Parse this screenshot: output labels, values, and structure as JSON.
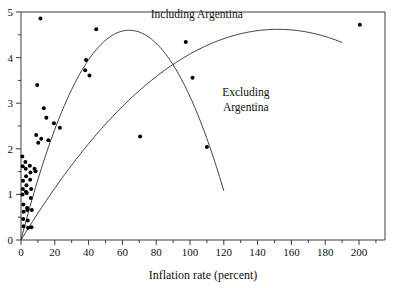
{
  "chart_data": {
    "type": "scatter",
    "title": "",
    "subtitle": "",
    "xlabel": "Inflation rate (percent)",
    "ylabel": "",
    "xlim": [
      0,
      212
    ],
    "ylim": [
      0,
      5
    ],
    "grid": false,
    "legend_position": "inline-annotations",
    "x_ticks": [
      0,
      20,
      40,
      60,
      80,
      100,
      120,
      140,
      160,
      180,
      200
    ],
    "x_tick_labels": [
      "0",
      "20",
      "40",
      "60",
      "80",
      "100",
      "120",
      "140",
      "160",
      "180",
      "200"
    ],
    "x_minor_ticks": [
      10,
      30,
      50,
      70,
      90,
      110,
      130,
      150,
      170,
      190,
      210
    ],
    "y_ticks": [
      0,
      1,
      2,
      3,
      4,
      5
    ],
    "y_tick_labels": [
      "0",
      "1",
      "2",
      "3",
      "4",
      "5"
    ],
    "y_minor_ticks": [
      0.5,
      1.5,
      2.5,
      3.5,
      4.5
    ],
    "points": [
      {
        "x": 0.8,
        "y": 1.83
      },
      {
        "x": 1.0,
        "y": 1.62
      },
      {
        "x": 1.2,
        "y": 1.3
      },
      {
        "x": 1.1,
        "y": 1.12
      },
      {
        "x": 0.9,
        "y": 1.0
      },
      {
        "x": 1.4,
        "y": 0.78
      },
      {
        "x": 1.6,
        "y": 0.62
      },
      {
        "x": 1.3,
        "y": 0.46
      },
      {
        "x": 1.5,
        "y": 0.3
      },
      {
        "x": 2.6,
        "y": 1.71
      },
      {
        "x": 2.8,
        "y": 1.56
      },
      {
        "x": 3.0,
        "y": 1.4
      },
      {
        "x": 3.2,
        "y": 1.2
      },
      {
        "x": 2.9,
        "y": 1.06
      },
      {
        "x": 3.4,
        "y": 1.03
      },
      {
        "x": 3.6,
        "y": 0.7
      },
      {
        "x": 3.8,
        "y": 0.66
      },
      {
        "x": 4.0,
        "y": 0.43
      },
      {
        "x": 4.2,
        "y": 0.27
      },
      {
        "x": 5.2,
        "y": 1.63
      },
      {
        "x": 5.6,
        "y": 1.48
      },
      {
        "x": 5.4,
        "y": 1.32
      },
      {
        "x": 6.0,
        "y": 1.12
      },
      {
        "x": 5.8,
        "y": 0.92
      },
      {
        "x": 6.4,
        "y": 0.66
      },
      {
        "x": 6.2,
        "y": 0.28
      },
      {
        "x": 8.0,
        "y": 1.56
      },
      {
        "x": 8.6,
        "y": 1.51
      },
      {
        "x": 9.0,
        "y": 2.3
      },
      {
        "x": 10.2,
        "y": 2.13
      },
      {
        "x": 9.6,
        "y": 3.4
      },
      {
        "x": 11.5,
        "y": 4.86
      },
      {
        "x": 12.0,
        "y": 2.22
      },
      {
        "x": 13.5,
        "y": 2.89
      },
      {
        "x": 15.0,
        "y": 2.68
      },
      {
        "x": 16.2,
        "y": 2.19
      },
      {
        "x": 19.5,
        "y": 2.56
      },
      {
        "x": 23.0,
        "y": 2.46
      },
      {
        "x": 38.5,
        "y": 3.95
      },
      {
        "x": 38.0,
        "y": 3.72
      },
      {
        "x": 40.5,
        "y": 3.61
      },
      {
        "x": 44.5,
        "y": 4.62
      },
      {
        "x": 70.5,
        "y": 2.27
      },
      {
        "x": 97.5,
        "y": 4.34
      },
      {
        "x": 101.5,
        "y": 3.56
      },
      {
        "x": 110.0,
        "y": 2.04
      },
      {
        "x": 200.5,
        "y": 4.72
      }
    ],
    "curves": [
      {
        "name": "Including Argentina",
        "label": "Including Argentina",
        "x_range": [
          0,
          190
        ],
        "vertex_x": 152,
        "vertex_y": 4.62,
        "y_at_x0": 0.0,
        "description": "Concave quadratic fit peaking near inflation 150 percent at about 4.6, drawn across the full data range including the Argentina observation near 200 percent."
      },
      {
        "name": "Excluding Argentina",
        "label": "Excluding Argentina",
        "x_range": [
          0,
          120
        ],
        "vertex_x": 64,
        "vertex_y": 4.6,
        "y_at_x0": 0.0,
        "description": "Concave quadratic fit peaking near inflation 64 percent at about 4.6, then falling to about 2.0 at inflation 120 percent; fitted after dropping the Argentina observation."
      }
    ],
    "annotations": [
      {
        "text": "Including Argentina",
        "x": 104,
        "y": 4.87
      },
      {
        "text": "Excluding",
        "x": 133,
        "y": 3.15
      },
      {
        "text": "Argentina",
        "x": 133,
        "y": 2.82
      }
    ]
  },
  "axes": {
    "x_title": "Inflation rate (percent)",
    "y_title": ""
  },
  "labels": {
    "including": "Including Argentina",
    "excluding_line1": "Excluding",
    "excluding_line2": "Argentina"
  },
  "colors": {
    "point": "#000000",
    "curve": "#2b2b2b",
    "frame": "#3a3a3a",
    "text": "#111111",
    "background": "#ffffff"
  }
}
